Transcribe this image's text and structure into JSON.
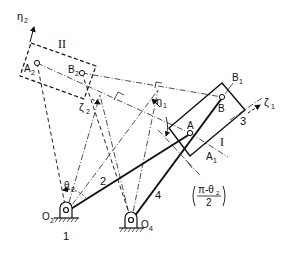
{
  "diagram": {
    "type": "four-bar linkage two-position synthesis",
    "labels": {
      "eta2": "η",
      "eta2_sub": "2",
      "zeta2": "ζ",
      "zeta2_sub": "2",
      "eta1": "η",
      "eta1_sub": "1",
      "zeta1": "ζ",
      "zeta1_sub": "1",
      "box2": "II",
      "box1": "I",
      "A2": "A",
      "A2_sub": "2",
      "B2": "B",
      "B2_sub": "2",
      "A": "A",
      "B": "B",
      "A1": "A",
      "A1_sub": "1",
      "B1": "B",
      "B1_sub": "1",
      "link3": "3",
      "link2": "2",
      "link4": "4",
      "ground": "1",
      "O2": "O",
      "O2_sub": "2",
      "O4": "O",
      "O4_sub": "4",
      "theta2": "θ",
      "theta2_sub": "2",
      "angle_num": "π-θ",
      "angle_num_sub": "2",
      "angle_den": "2"
    },
    "colors": {
      "line": "#111111",
      "background": "#ffffff"
    }
  }
}
